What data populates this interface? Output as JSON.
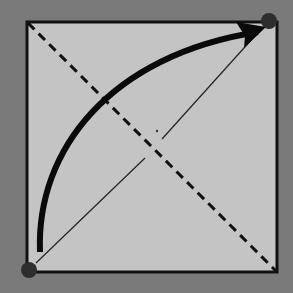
{
  "diagram": {
    "background_color": "#7a7a7a",
    "square": {
      "x": 27,
      "y": 22,
      "width": 250,
      "height": 250,
      "fill": "#c4c4c4",
      "stroke": "#111111"
    },
    "diagonal_dashed": {
      "from": [
        27,
        22
      ],
      "to": [
        277,
        272
      ],
      "style": "dashed"
    },
    "diagonal_thin": {
      "from": [
        29,
        270
      ],
      "to": [
        269,
        20
      ],
      "style": "thin solid",
      "gap_near_center": true
    },
    "arc_arrow": {
      "from": [
        40,
        252
      ],
      "to": [
        266,
        27
      ],
      "style": "thick curved arrow"
    },
    "points": [
      {
        "name": "start-point",
        "cx": 29,
        "cy": 270
      },
      {
        "name": "end-point",
        "cx": 269,
        "cy": 21
      }
    ],
    "center_dot": {
      "cx": 157,
      "cy": 131
    }
  }
}
